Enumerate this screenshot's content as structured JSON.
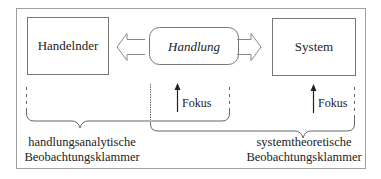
{
  "diagram": {
    "nodes": {
      "actor": {
        "label": "Handelnder"
      },
      "action": {
        "label": "Handlung"
      },
      "system": {
        "label": "System"
      }
    },
    "focus": {
      "middle_label": "Fokus",
      "right_label": "Fokus"
    },
    "brackets": {
      "left": {
        "line1": "handlungsanalytische",
        "line2": "Beobachtungsklammer"
      },
      "right": {
        "line1": "systemtheoretische",
        "line2": "Beobachtungsklammer"
      }
    },
    "colors": {
      "stroke": "#777777",
      "text": "#222222",
      "frame": "#999999"
    }
  }
}
